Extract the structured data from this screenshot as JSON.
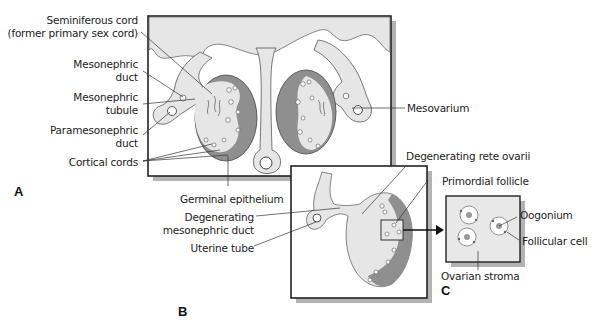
{
  "figure": {
    "panels": [
      {
        "id": "A",
        "letter": "A",
        "description": "Indifferent gonad / early ovary development, transverse section with both gonads"
      },
      {
        "id": "B",
        "letter": "B",
        "description": "Developing ovary with degenerating mesonephric structures"
      },
      {
        "id": "C",
        "letter": "C",
        "description": "Enlarged view of primordial follicles"
      }
    ],
    "labels_A": {
      "seminiferous_cord_1": "Seminiferous cord",
      "seminiferous_cord_2": "(former primary sex cord)",
      "mesonephric_duct_1": "Mesonephric",
      "mesonephric_duct_2": "duct",
      "mesonephric_tubule_1": "Mesonephric",
      "mesonephric_tubule_2": "tubule",
      "paramesonephric_duct_1": "Paramesonephric",
      "paramesonephric_duct_2": "duct",
      "cortical_cords": "Cortical cords",
      "mesovarium": "Mesovarium",
      "germinal_epithelium": "Germinal epithelium"
    },
    "labels_B": {
      "degenerating_rete_ovarii": "Degenerating rete ovarii",
      "primordial_follicle": "Primordial follicle",
      "degenerating_mesonephric_duct_1": "Degenerating",
      "degenerating_mesonephric_duct_2": "mesonephric duct",
      "uterine_tube": "Uterine tube"
    },
    "labels_C": {
      "oogonium": "Oogonium",
      "follicular_cell": "Follicular cell",
      "ovarian_stroma": "Ovarian stroma"
    },
    "colors": {
      "tissue_light": "#e4e4e4",
      "cortex_dark": "#8f8f8f",
      "panel_shadow": "#b3b3b3",
      "outline": "#333333",
      "nucleus": "#999999"
    }
  }
}
